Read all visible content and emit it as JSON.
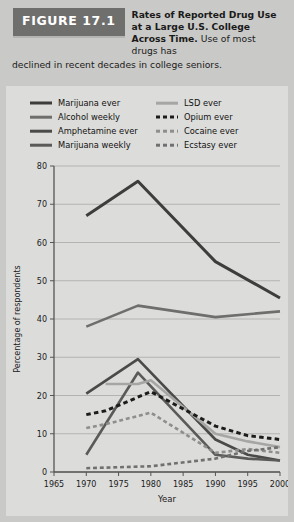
{
  "figure": {
    "badge": "FIGURE 17.1",
    "title_bold": "Rates of Reported Drug Use at a Large U.S. College Across Time.",
    "title_rest": " Use of most drugs has",
    "subtitle": "declined in recent decades in college seniors."
  },
  "colors": {
    "page_background": "#c9c9c7",
    "panel_background": "#dcdcda",
    "badge_background": "#6f6f6d",
    "axis": "#555553",
    "grid": "#a8a8a6",
    "marijuana_ever": "#3d3d3b",
    "alcohol_weekly": "#6e6e6c",
    "amphetamine_ever": "#4a4a48",
    "marijuana_weekly": "#5a5a58",
    "lsd_ever": "#a6a6a4",
    "opium_ever": "#1c1c1a",
    "cocaine_ever": "#8e8e8c",
    "ecstasy_ever": "#707070"
  },
  "legend": [
    {
      "label": "Marijuana ever",
      "key": "marijuana_ever",
      "style": "solid",
      "color": "#3d3d3b",
      "width": 3.0
    },
    {
      "label": "LSD ever",
      "key": "lsd_ever",
      "style": "solid",
      "color": "#a6a6a4",
      "width": 2.6
    },
    {
      "label": "Alcohol weekly",
      "key": "alcohol_weekly",
      "style": "solid",
      "color": "#6e6e6c",
      "width": 2.6
    },
    {
      "label": "Opium ever",
      "key": "opium_ever",
      "style": "dashed",
      "color": "#1c1c1a",
      "width": 3.0
    },
    {
      "label": "Amphetamine ever",
      "key": "amphetamine_ever",
      "style": "solid",
      "color": "#4a4a48",
      "width": 2.6
    },
    {
      "label": "Cocaine ever",
      "key": "cocaine_ever",
      "style": "dashed",
      "color": "#8e8e8c",
      "width": 2.6
    },
    {
      "label": "Marijuana weekly",
      "key": "marijuana_weekly",
      "style": "solid",
      "color": "#5a5a58",
      "width": 2.6
    },
    {
      "label": "Ecstasy ever",
      "key": "ecstasy_ever",
      "style": "dashed",
      "color": "#707070",
      "width": 2.6
    }
  ],
  "chart_data": {
    "type": "line",
    "title": "Rates of Reported Drug Use at a Large U.S. College Across Time",
    "xlabel": "Year",
    "ylabel": "Percentage of respondents",
    "xlim": [
      1965,
      2000
    ],
    "ylim": [
      0,
      80
    ],
    "xticks": [
      1965,
      1970,
      1975,
      1980,
      1985,
      1990,
      1995,
      2000
    ],
    "yticks": [
      0,
      10,
      20,
      30,
      40,
      50,
      60,
      70,
      80
    ],
    "grid": true,
    "legend_position": "top",
    "series": [
      {
        "name": "Marijuana ever",
        "style": "solid",
        "color": "#3d3d3b",
        "width": 3.0,
        "x": [
          1970,
          1978,
          1990,
          2000
        ],
        "values": [
          67,
          76,
          55,
          45.5
        ]
      },
      {
        "name": "Alcohol weekly",
        "style": "solid",
        "color": "#6e6e6c",
        "width": 2.6,
        "x": [
          1970,
          1978,
          1990,
          2000
        ],
        "values": [
          38,
          43.5,
          40.5,
          42
        ]
      },
      {
        "name": "Amphetamine ever",
        "style": "solid",
        "color": "#4a4a48",
        "width": 2.6,
        "x": [
          1970,
          1978,
          1990,
          1995,
          2000
        ],
        "values": [
          20.5,
          29.5,
          8.5,
          4.5,
          3
        ]
      },
      {
        "name": "Marijuana weekly",
        "style": "solid",
        "color": "#5a5a58",
        "width": 2.6,
        "x": [
          1970,
          1978,
          1990,
          1995,
          2000
        ],
        "values": [
          4.5,
          26,
          4.5,
          3.5,
          3
        ]
      },
      {
        "name": "LSD ever",
        "style": "solid",
        "color": "#a6a6a4",
        "width": 2.6,
        "x": [
          1973,
          1978,
          1980,
          1990,
          1995,
          2000
        ],
        "values": [
          23,
          23,
          24,
          10,
          8,
          6.5
        ]
      },
      {
        "name": "Opium ever",
        "style": "dashed",
        "color": "#1c1c1a",
        "width": 3.0,
        "x": [
          1970,
          1973,
          1980,
          1990,
          1995,
          2000
        ],
        "values": [
          15,
          16,
          21,
          12,
          9.5,
          8.5
        ]
      },
      {
        "name": "Cocaine ever",
        "style": "dashed",
        "color": "#8e8e8c",
        "width": 2.6,
        "x": [
          1970,
          1973,
          1980,
          1990,
          1995,
          2000
        ],
        "values": [
          11.5,
          12.5,
          15.5,
          5,
          6,
          5
        ]
      },
      {
        "name": "Ecstasy ever",
        "style": "dashed",
        "color": "#707070",
        "width": 2.6,
        "x": [
          1970,
          1980,
          1990,
          1995,
          2000
        ],
        "values": [
          1,
          1.5,
          3.5,
          5.5,
          6.5
        ]
      }
    ]
  }
}
